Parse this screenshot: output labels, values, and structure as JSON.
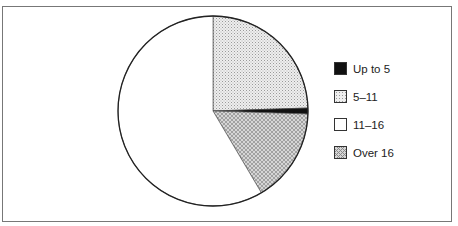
{
  "chart_data": {
    "type": "pie",
    "title": "",
    "start_angle_deg": 0,
    "direction": "clockwise",
    "categories": [
      "5–11",
      "Up to 5",
      "Over 16",
      "11–16"
    ],
    "values": [
      24.5,
      1,
      16,
      58.5
    ],
    "unit": "percent (estimated)",
    "legend": {
      "position": "right",
      "entries": [
        {
          "label": "Up to 5",
          "fill": "solid-black"
        },
        {
          "label": "5–11",
          "fill": "light-dot-pattern"
        },
        {
          "label": "11–16",
          "fill": "white"
        },
        {
          "label": "Over 16",
          "fill": "crosshatch-pattern"
        }
      ]
    }
  },
  "legend": {
    "items": [
      {
        "label": "Up to 5"
      },
      {
        "label": "5–11"
      },
      {
        "label": "11–16"
      },
      {
        "label": "Over 16"
      }
    ]
  }
}
